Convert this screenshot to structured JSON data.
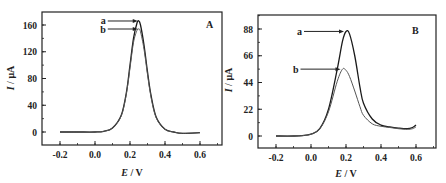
{
  "chart_data": [
    {
      "type": "line",
      "panel": "A",
      "title": "",
      "xlabel": "E / V",
      "ylabel": "I / μA",
      "xlim": [
        -0.3,
        0.7
      ],
      "ylim": [
        -20,
        180
      ],
      "xticks": [
        "-0.2",
        "0.0",
        "0.2",
        "0.4",
        "0.6"
      ],
      "yticks": [
        "0",
        "40",
        "80",
        "120",
        "160"
      ],
      "grid": false,
      "legend": "inline arrow labels",
      "series": [
        {
          "name": "a",
          "x": [
            -0.2,
            -0.1,
            0.0,
            0.05,
            0.1,
            0.15,
            0.18,
            0.2,
            0.22,
            0.24,
            0.25,
            0.26,
            0.28,
            0.3,
            0.32,
            0.35,
            0.4,
            0.45,
            0.5,
            0.6
          ],
          "y": [
            0,
            0,
            0,
            1,
            6,
            25,
            60,
            100,
            140,
            163,
            166,
            160,
            130,
            90,
            55,
            22,
            4,
            0,
            -2,
            -1
          ],
          "peak": {
            "x": 0.25,
            "y": 166
          }
        },
        {
          "name": "b",
          "x": [
            -0.2,
            -0.1,
            0.0,
            0.05,
            0.1,
            0.15,
            0.18,
            0.2,
            0.22,
            0.24,
            0.25,
            0.26,
            0.28,
            0.3,
            0.32,
            0.35,
            0.4,
            0.45,
            0.5,
            0.6
          ],
          "y": [
            0,
            0,
            0,
            1,
            6,
            24,
            58,
            96,
            134,
            152,
            154,
            150,
            124,
            86,
            52,
            21,
            4,
            0,
            -2,
            -1
          ],
          "peak": {
            "x": 0.25,
            "y": 154
          }
        }
      ]
    },
    {
      "type": "line",
      "panel": "B",
      "title": "",
      "xlabel": "E / V",
      "ylabel": "I / μA",
      "xlim": [
        -0.3,
        0.7
      ],
      "ylim": [
        -8,
        98
      ],
      "xticks": [
        "-0.2",
        "0.0",
        "0.2",
        "0.4",
        "0.6"
      ],
      "yticks": [
        "0",
        "22",
        "44",
        "66",
        "88"
      ],
      "grid": false,
      "legend": "inline arrow labels",
      "series": [
        {
          "name": "a",
          "x": [
            -0.2,
            -0.1,
            -0.05,
            0.0,
            0.05,
            0.1,
            0.15,
            0.18,
            0.2,
            0.22,
            0.25,
            0.28,
            0.3,
            0.35,
            0.4,
            0.45,
            0.5,
            0.55,
            0.58,
            0.6
          ],
          "y": [
            0,
            0,
            0.3,
            1.5,
            6,
            22,
            55,
            78,
            86,
            84,
            66,
            40,
            27,
            14,
            9,
            7.5,
            6.5,
            6,
            7,
            9
          ],
          "peak": {
            "x": 0.2,
            "y": 86
          }
        },
        {
          "name": "b",
          "x": [
            -0.2,
            -0.1,
            -0.05,
            0.0,
            0.05,
            0.1,
            0.15,
            0.18,
            0.2,
            0.22,
            0.25,
            0.28,
            0.3,
            0.35,
            0.4,
            0.45,
            0.5,
            0.55,
            0.58,
            0.6
          ],
          "y": [
            0,
            0,
            0.3,
            1.5,
            6,
            20,
            45,
            55,
            54,
            49,
            37,
            24,
            17,
            10,
            8,
            7,
            6,
            5.5,
            6,
            7.5
          ],
          "peak": {
            "x": 0.18,
            "y": 55
          }
        }
      ]
    }
  ],
  "panels": {
    "A": {
      "label": "A",
      "xlabel_italic": "E",
      "xlabel_rest": " / V",
      "ylabel_italic": "I",
      "ylabel_rest": " / μA",
      "xticks": [
        "-0.2",
        "0.0",
        "0.2",
        "0.4",
        "0.6"
      ],
      "yticks": [
        "0",
        "40",
        "80",
        "120",
        "160"
      ],
      "curve_labels": [
        "a",
        "b"
      ]
    },
    "B": {
      "label": "B",
      "xlabel_italic": "E",
      "xlabel_rest": " / V",
      "ylabel_italic": "I",
      "ylabel_rest": " / μA",
      "xticks": [
        "-0.2",
        "0.0",
        "0.2",
        "0.4",
        "0.6"
      ],
      "yticks": [
        "0",
        "22",
        "44",
        "66",
        "88"
      ],
      "curve_labels": [
        "a",
        "b"
      ]
    }
  },
  "colors": {
    "axis": "#222222",
    "curve_a": "#1a1a1a",
    "curve_b": "#555555"
  }
}
